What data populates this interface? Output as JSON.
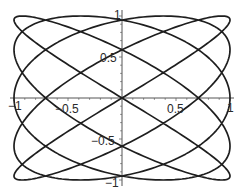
{
  "chart_data": {
    "type": "line",
    "subtype": "parametric",
    "title": "",
    "xlabel": "",
    "ylabel": "",
    "equation": {
      "x": "sin(5t)",
      "y": "sin(4t)",
      "t_range": [
        0,
        6.283185307
      ],
      "x_freq": 5,
      "y_freq": 4,
      "phase": 0,
      "samples": 800
    },
    "xlim": [
      -1,
      1
    ],
    "ylim": [
      -1,
      1
    ],
    "grid": false,
    "legend": null,
    "axes_through_origin": true,
    "x_ticks": [
      {
        "value": -1,
        "label": "−1"
      },
      {
        "value": -0.5,
        "label": "−0.5"
      },
      {
        "value": 0.5,
        "label": "0.5"
      },
      {
        "value": 1,
        "label": "1"
      }
    ],
    "y_ticks": [
      {
        "value": 1,
        "label": "1"
      },
      {
        "value": 0.5,
        "label": "0.5"
      },
      {
        "value": -0.5,
        "label": "−0.5"
      },
      {
        "value": -1,
        "label": "−1"
      }
    ],
    "minor_tick_step": 0.1,
    "series": [
      {
        "name": "lissajous",
        "color": "#1e1e1e"
      }
    ]
  },
  "layout": {
    "origin_px": [
      122,
      98
    ],
    "unit_px": [
      108,
      82
    ]
  }
}
